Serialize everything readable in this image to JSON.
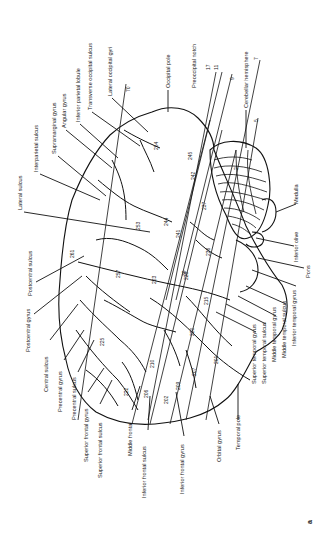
{
  "figure": {
    "panel_label": "a",
    "orientation": "rotated 90 degrees counter-clockwise",
    "ink_color": "#111111",
    "background_color": "#ffffff"
  },
  "labels": {
    "lateral_sulcus": "Lateral sulcus",
    "interparietal_sulcus": "Interparietal sulcus",
    "supramarginal_gyrus": "Supramarginal gyrus",
    "angular_gyrus": "Angular gyrus",
    "inferior_parietal_lobule": "Inferior parietal lobule",
    "transverse_occipital_sulcus": "Transverse occipital sulcus",
    "lateral_occipital_gyri": "Lateral occipital gyri",
    "occipital_pole": "Occipital pole",
    "preoccipital_notch": "Preoccipital notch",
    "cerebellar_hemisphere": "Cerebellar hemisphere",
    "medulla": "Medulla",
    "inferior_olive": "Inferior olive",
    "pons": "Pons",
    "inferior_temporal_gyrus_r": "Inferior temporal gyrus",
    "middle_temporal_sulcus": "Middle temporal sulcus",
    "middle_temporal_gyrus": "Middle temporal gyrus",
    "superior_temporal_sulcus": "Superior temporal sulcus",
    "superior_temporal_gyrus": "Superior temporal gyrus",
    "temporal_pole": "Temporal pole",
    "orbital_gyrus": "Orbital gyrus",
    "inferior_frontal_gyrus": "Inferior frontal gyrus",
    "inferior_frontal_sulcus": "Inferior frontal sulcus",
    "middle_frontal": "Middle frontal",
    "superior_frontal_sulcus": "Superior frontal sulcus",
    "superior_frontal_gyrus": "Superior frontal gyrus",
    "precentral_sulcus": "Precentral sulcus",
    "precentral_gyrus": "Precentral gyrus",
    "central_sulcus": "Central sulcus",
    "postcentral_gyrus": "Postcentral gyrus",
    "postcentral_sulcus": "Postcentral sulcus"
  },
  "cut_numbers": {
    "n70": "70",
    "n17": "17",
    "n11": "11",
    "n9": "9",
    "n7": "7",
    "n5": "5"
  },
  "region_numbers": {
    "r254": "254",
    "r245": "245",
    "r242": "242",
    "r237": "237",
    "r253": "253",
    "r244": "244",
    "r241": "241",
    "r236": "236",
    "r261": "261",
    "r257": "257",
    "r223": "223",
    "r228": "228",
    "r225": "225",
    "r220": "220",
    "r215": "215",
    "r210": "210",
    "r207": "207",
    "r206": "206",
    "r201": "201",
    "r209": "209",
    "r222": "222",
    "r202": "202",
    "r39": "39",
    "r2": "2"
  }
}
